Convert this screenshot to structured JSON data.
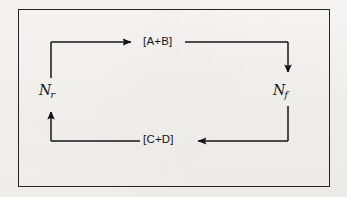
{
  "figure": {
    "type": "cycle-diagram",
    "frame": {
      "border_color": "#25252a"
    },
    "background_color": "#f2f1ee",
    "ink_color": "#151519"
  },
  "nodes": [
    {
      "id": "state-ab",
      "label": "[A+B]",
      "position": "top"
    },
    {
      "id": "state-cd",
      "label": "[C+D]",
      "position": "bottom"
    }
  ],
  "rates": [
    {
      "id": "rate-reverse",
      "symbol": "N",
      "subscript": "r",
      "position": "left"
    },
    {
      "id": "rate-forward",
      "symbol": "N",
      "subscript": "f",
      "position": "right"
    }
  ],
  "arrows": [
    {
      "id": "arrow-top",
      "direction": "right",
      "from": "left-riser",
      "to": "state-ab"
    },
    {
      "id": "arrow-right",
      "direction": "down",
      "from": "state-ab",
      "to": "rate-forward"
    },
    {
      "id": "arrow-bottom",
      "direction": "left",
      "from": "right-riser",
      "to": "state-cd"
    },
    {
      "id": "arrow-left",
      "direction": "up",
      "from": "state-cd",
      "to": "rate-reverse"
    }
  ]
}
